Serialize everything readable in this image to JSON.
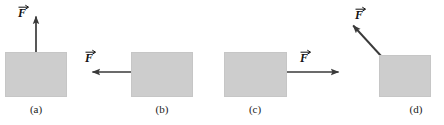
{
  "figure": {
    "background_color": "#ffffff",
    "width": 444,
    "height": 125,
    "block_fill_color": "#cdcdcd",
    "arrow_color": "#3a3a3a",
    "label_color": "#111111"
  },
  "panels": [
    {
      "id": "a",
      "caption": "(a)",
      "force_label": "F",
      "force_direction": "up",
      "force_angle_deg": 90,
      "block": {
        "x": 5,
        "y": 52,
        "width": 62,
        "height": 45
      },
      "arrow": {
        "x1": 36,
        "y1": 52,
        "x2": 36,
        "y2": 12
      },
      "label_pos": {
        "x": 18,
        "y": 4
      },
      "caption_pos": {
        "x": 16,
        "y": 103
      }
    },
    {
      "id": "b",
      "caption": "(b)",
      "force_label": "F",
      "force_direction": "left",
      "force_angle_deg": 180,
      "block": {
        "x": 131,
        "y": 52,
        "width": 62,
        "height": 45
      },
      "arrow": {
        "x1": 131,
        "y1": 72,
        "x2": 88,
        "y2": 72
      },
      "label_pos": {
        "x": 85,
        "y": 49
      },
      "caption_pos": {
        "x": 142,
        "y": 103
      }
    },
    {
      "id": "c",
      "caption": "(c)",
      "force_label": "F",
      "force_direction": "right",
      "force_angle_deg": 0,
      "block": {
        "x": 224,
        "y": 52,
        "width": 63,
        "height": 45
      },
      "arrow": {
        "x1": 287,
        "y1": 72,
        "x2": 343,
        "y2": 72
      },
      "label_pos": {
        "x": 300,
        "y": 49
      },
      "caption_pos": {
        "x": 235,
        "y": 103
      }
    },
    {
      "id": "d",
      "caption": "(d)",
      "force_label": "F",
      "force_direction": "up-left",
      "force_angle_deg": 135,
      "block": {
        "x": 379,
        "y": 55,
        "width": 52,
        "height": 42
      },
      "arrow": {
        "x1": 382,
        "y1": 57,
        "x2": 350,
        "y2": 22
      },
      "label_pos": {
        "x": 355,
        "y": 6
      },
      "caption_pos": {
        "x": 396,
        "y": 103
      }
    }
  ]
}
